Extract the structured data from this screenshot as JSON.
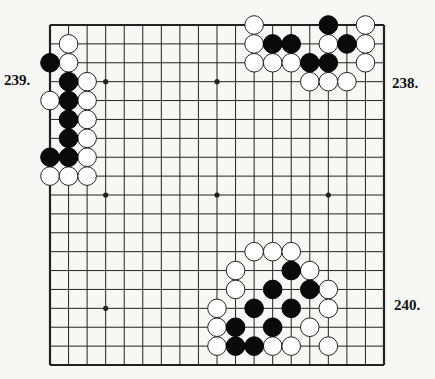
{
  "diagram": {
    "type": "go-board",
    "size": 19,
    "colors": {
      "background": "#f7f7f5",
      "line": "#222222",
      "black_stone": "#0a0a0a",
      "white_stone": "#ffffff"
    },
    "star_points": [
      [
        3,
        3
      ],
      [
        3,
        9
      ],
      [
        3,
        15
      ],
      [
        9,
        3
      ],
      [
        9,
        9
      ],
      [
        9,
        15
      ],
      [
        15,
        3
      ],
      [
        15,
        9
      ],
      [
        15,
        15
      ]
    ],
    "problems": [
      {
        "label": "239.",
        "position": "left",
        "black": [
          [
            2,
            0
          ],
          [
            3,
            1
          ],
          [
            4,
            1
          ],
          [
            5,
            1
          ],
          [
            6,
            1
          ],
          [
            7,
            0
          ],
          [
            7,
            1
          ]
        ],
        "white": [
          [
            1,
            1
          ],
          [
            2,
            1
          ],
          [
            3,
            2
          ],
          [
            4,
            0
          ],
          [
            4,
            2
          ],
          [
            5,
            2
          ],
          [
            6,
            2
          ],
          [
            7,
            2
          ],
          [
            8,
            0
          ],
          [
            8,
            1
          ],
          [
            8,
            2
          ]
        ]
      },
      {
        "label": "238.",
        "position": "right",
        "black": [
          [
            0,
            15
          ],
          [
            1,
            12
          ],
          [
            1,
            13
          ],
          [
            1,
            16
          ],
          [
            2,
            14
          ],
          [
            2,
            15
          ]
        ],
        "white": [
          [
            0,
            11
          ],
          [
            0,
            17
          ],
          [
            1,
            11
          ],
          [
            1,
            15
          ],
          [
            1,
            17
          ],
          [
            2,
            11
          ],
          [
            2,
            12
          ],
          [
            2,
            13
          ],
          [
            2,
            17
          ],
          [
            3,
            14
          ],
          [
            3,
            15
          ],
          [
            3,
            16
          ]
        ]
      },
      {
        "label": "240.",
        "position": "right",
        "black": [
          [
            13,
            13
          ],
          [
            14,
            12
          ],
          [
            14,
            14
          ],
          [
            15,
            11
          ],
          [
            15,
            13
          ],
          [
            16,
            10
          ],
          [
            16,
            12
          ],
          [
            17,
            10
          ],
          [
            17,
            11
          ]
        ],
        "white": [
          [
            12,
            11
          ],
          [
            12,
            12
          ],
          [
            12,
            13
          ],
          [
            13,
            10
          ],
          [
            13,
            14
          ],
          [
            14,
            10
          ],
          [
            14,
            15
          ],
          [
            15,
            9
          ],
          [
            15,
            15
          ],
          [
            16,
            9
          ],
          [
            16,
            14
          ],
          [
            17,
            9
          ],
          [
            17,
            12
          ],
          [
            17,
            13
          ],
          [
            17,
            15
          ]
        ]
      }
    ]
  }
}
